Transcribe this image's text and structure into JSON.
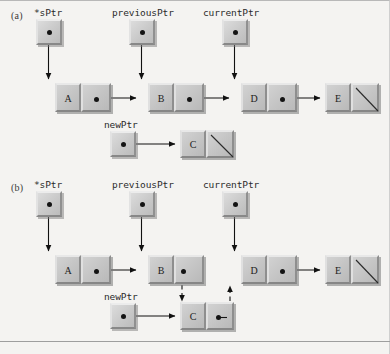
{
  "figure": {
    "background_color": "#f4f3f1",
    "line_color": "#1a1a1a",
    "cell_fill": "#c6c6c6"
  },
  "parts": [
    {
      "id": "a",
      "label": "(a)",
      "caption": "Before insertion: newPtr node C not yet linked"
    },
    {
      "id": "b",
      "label": "(b)",
      "caption": "After insertion: C linked between B and D"
    }
  ],
  "part_a": {
    "label": "(a)",
    "pointers": [
      {
        "name": "*sPtr",
        "label": "*sPtr",
        "target": "node-a"
      },
      {
        "name": "previousPtr",
        "label": "previousPtr",
        "target": "node-b"
      },
      {
        "name": "currentPtr",
        "label": "currentPtr",
        "target": "node-d"
      },
      {
        "name": "newPtr",
        "label": "newPtr",
        "target": "node-c"
      }
    ],
    "nodes": [
      {
        "id": "node-a",
        "value": "A",
        "next": "node-b",
        "null_pointer": false
      },
      {
        "id": "node-b",
        "value": "B",
        "next": "node-d",
        "null_pointer": false
      },
      {
        "id": "node-d",
        "value": "D",
        "next": "node-e",
        "null_pointer": false
      },
      {
        "id": "node-e",
        "value": "E",
        "next": null,
        "null_pointer": true
      },
      {
        "id": "node-c",
        "value": "C",
        "next": null,
        "null_pointer": true
      }
    ],
    "links": [
      {
        "from": "node-a",
        "to": "node-b",
        "style": "solid"
      },
      {
        "from": "node-b",
        "to": "node-d",
        "style": "solid"
      },
      {
        "from": "node-d",
        "to": "node-e",
        "style": "solid"
      },
      {
        "from": "newPtr",
        "to": "node-c",
        "style": "solid"
      }
    ]
  },
  "part_b": {
    "label": "(b)",
    "pointers": [
      {
        "name": "*sPtr",
        "label": "*sPtr",
        "target": "node-a"
      },
      {
        "name": "previousPtr",
        "label": "previousPtr",
        "target": "node-b"
      },
      {
        "name": "currentPtr",
        "label": "currentPtr",
        "target": "node-d"
      },
      {
        "name": "newPtr",
        "label": "newPtr",
        "target": "node-c"
      }
    ],
    "nodes": [
      {
        "id": "node-a",
        "value": "A",
        "next": "node-b",
        "null_pointer": false
      },
      {
        "id": "node-b",
        "value": "B",
        "next": "node-c",
        "null_pointer": false
      },
      {
        "id": "node-d",
        "value": "D",
        "next": "node-e",
        "null_pointer": false
      },
      {
        "id": "node-e",
        "value": "E",
        "next": null,
        "null_pointer": true
      },
      {
        "id": "node-c",
        "value": "C",
        "next": "node-d",
        "null_pointer": false
      }
    ],
    "links": [
      {
        "from": "node-a",
        "to": "node-b",
        "style": "solid"
      },
      {
        "from": "node-d",
        "to": "node-e",
        "style": "solid"
      },
      {
        "from": "newPtr",
        "to": "node-c",
        "style": "solid"
      },
      {
        "from": "node-b",
        "to": "node-c",
        "style": "dashed"
      },
      {
        "from": "node-c",
        "to": "node-d",
        "style": "dashed"
      }
    ]
  }
}
